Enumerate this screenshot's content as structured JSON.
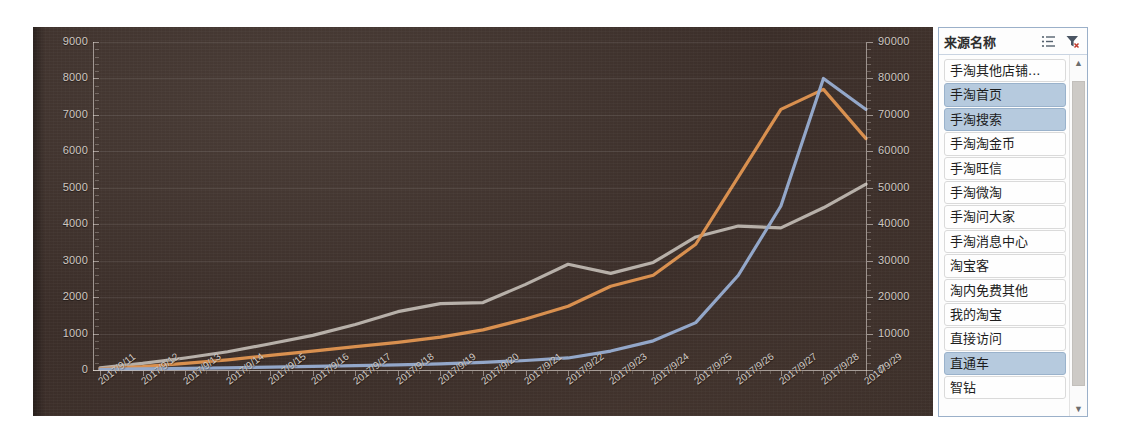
{
  "chart_data": {
    "type": "line",
    "title": "",
    "xlabel": "",
    "ylabel": "",
    "grid": true,
    "legend_position": "right-panel",
    "categories": [
      "2017/9/11",
      "2017/9/12",
      "2017/9/13",
      "2017/9/14",
      "2017/9/15",
      "2017/9/16",
      "2017/9/17",
      "2017/9/18",
      "2017/9/19",
      "2017/9/20",
      "2017/9/21",
      "2017/9/22",
      "2017/9/23",
      "2017/9/24",
      "2017/9/25",
      "2017/9/26",
      "2017/9/27",
      "2017/9/28",
      "2017/9/29"
    ],
    "left_axis": {
      "ticks": [
        0,
        1000,
        2000,
        3000,
        4000,
        5000,
        6000,
        7000,
        8000,
        9000
      ],
      "ylim": [
        0,
        9000
      ],
      "tick_labels": [
        "0",
        "1000",
        "2000",
        "3000",
        "4000",
        "5000",
        "6000",
        "7000",
        "8000",
        "9000"
      ]
    },
    "right_axis": {
      "ticks": [
        0,
        10000,
        20000,
        30000,
        40000,
        50000,
        60000,
        70000,
        80000,
        90000
      ],
      "ylim": [
        0,
        90000
      ],
      "tick_labels": [
        "0",
        "10000",
        "20000",
        "30000",
        "40000",
        "50000",
        "60000",
        "70000",
        "80000",
        "90000"
      ]
    },
    "series": [
      {
        "name": "手淘搜索",
        "color": "#b7b0a9",
        "axis": "left",
        "values": [
          60,
          180,
          330,
          500,
          720,
          950,
          1250,
          1600,
          1820,
          1850,
          2350,
          2900,
          2650,
          2950,
          3650,
          3950,
          3900,
          4450,
          5100
        ]
      },
      {
        "name": "手淘首页",
        "color": "#d9904f",
        "axis": "left",
        "values": [
          30,
          90,
          180,
          280,
          400,
          520,
          640,
          760,
          900,
          1100,
          1400,
          1750,
          2300,
          2600,
          3450,
          5300,
          7150,
          7700,
          6350
        ]
      },
      {
        "name": "直通车",
        "color": "#93a7c9",
        "axis": "left",
        "values": [
          20,
          30,
          45,
          60,
          80,
          100,
          120,
          140,
          170,
          210,
          260,
          330,
          520,
          800,
          1300,
          2600,
          4500,
          8000,
          7150
        ]
      }
    ]
  },
  "legend": {
    "title": "来源名称",
    "icons": {
      "sort_list": "list-sort-icon",
      "clear_filter": "clear-filter-icon"
    },
    "items": [
      {
        "label": "手淘其他店铺...",
        "selected": false
      },
      {
        "label": "手淘首页",
        "selected": true
      },
      {
        "label": "手淘搜索",
        "selected": true
      },
      {
        "label": "手淘淘金币",
        "selected": false
      },
      {
        "label": "手淘旺信",
        "selected": false
      },
      {
        "label": "手淘微淘",
        "selected": false
      },
      {
        "label": "手淘问大家",
        "selected": false
      },
      {
        "label": "手淘消息中心",
        "selected": false
      },
      {
        "label": "淘宝客",
        "selected": false
      },
      {
        "label": "淘内免费其他",
        "selected": false
      },
      {
        "label": "我的淘宝",
        "selected": false
      },
      {
        "label": "直接访问",
        "selected": false
      },
      {
        "label": "直通车",
        "selected": true
      },
      {
        "label": "智钻",
        "selected": false
      }
    ],
    "scrollbar": {
      "up_arrow": "▲",
      "down_arrow": "▼"
    }
  },
  "colors": {
    "chart_background": "#43352e",
    "grid": "#6a5c54",
    "series_grey": "#b7b0a9",
    "series_orange": "#d9904f",
    "series_blue": "#93a7c9",
    "legend_selected": "#b6cade",
    "legend_border": "#9bb0c9"
  }
}
